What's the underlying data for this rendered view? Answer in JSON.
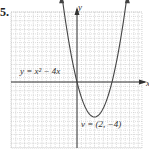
{
  "problem_number": "5.",
  "chart_data": {
    "type": "line",
    "title": "",
    "xlabel": "x",
    "ylabel": "y",
    "xlim": [
      -7.6,
      7.5
    ],
    "ylim": [
      -7.5,
      8
    ],
    "grid": true,
    "series": [
      {
        "name": "y = x² − 4x",
        "function": "x^2 - 4x",
        "x": [
          -1.7,
          -1,
          0,
          1,
          2,
          3,
          4,
          5,
          5.7
        ],
        "y": [
          9.69,
          5,
          0,
          -3,
          -4,
          -3,
          0,
          5,
          9.69
        ]
      }
    ],
    "annotations": [
      {
        "text": "y = x² − 4x",
        "kind": "equation-label"
      },
      {
        "text": "v = (2, −4)",
        "kind": "vertex-label",
        "x": 2,
        "y": -4
      }
    ],
    "colors": {
      "curve": "#444444",
      "axis": "#333333",
      "grid": "#bdbdbd"
    }
  }
}
